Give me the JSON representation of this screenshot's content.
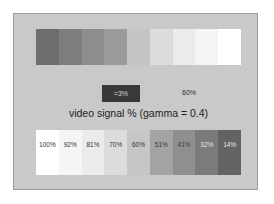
{
  "figure": {
    "caption": "video signal % (gamma = 0.4)",
    "background_color": "#c9c9c9",
    "border_color": "#9d9d9d",
    "page_color": "#ffffff"
  },
  "callouts": {
    "low_box": {
      "label": "=3%",
      "box_color": "#393939",
      "text_color": "#d8d8d8"
    },
    "mid_label": {
      "label": "60%",
      "text_color": "#2a2a2a"
    }
  },
  "chart_data": {
    "type": "bar",
    "title": "video signal % (gamma = 0.4)",
    "xlabel": "",
    "ylabel": "",
    "grid": false,
    "legend": "none",
    "orientation": "horizontal-strips",
    "series": [
      {
        "name": "top ramp (dark to light)",
        "categories": [
          "14%",
          "32%",
          "41%",
          "51%",
          "60%",
          "70%",
          "81%",
          "92%",
          "100%"
        ],
        "values": [
          14,
          32,
          41,
          51,
          60,
          70,
          81,
          92,
          100
        ],
        "colors": [
          "#6e6e6e",
          "#7d7d7d",
          "#8d8d8d",
          "#9b9b9b",
          "#c3c3c3",
          "#dcdcdc",
          "#ebebeb",
          "#f5f5f5",
          "#ffffff"
        ],
        "labels_visible": false
      },
      {
        "name": "bottom ramp (light to dark)",
        "categories": [
          "100%",
          "92%",
          "81%",
          "70%",
          "60%",
          "51%",
          "41%",
          "32%",
          "14%"
        ],
        "values": [
          100,
          92,
          81,
          70,
          60,
          51,
          41,
          32,
          14
        ],
        "colors": [
          "#ffffff",
          "#f5f5f5",
          "#ebebeb",
          "#dcdcdc",
          "#c6c6c6",
          "#a3a3a3",
          "#8f8f8f",
          "#7b7b7b",
          "#636363"
        ],
        "label_colors": [
          "#333333",
          "#333333",
          "#333333",
          "#333333",
          "#333333",
          "#3a3a3a",
          "#3d3d3d",
          "#e2e2e2",
          "#e8e8e8"
        ],
        "labels_visible": true
      }
    ]
  }
}
